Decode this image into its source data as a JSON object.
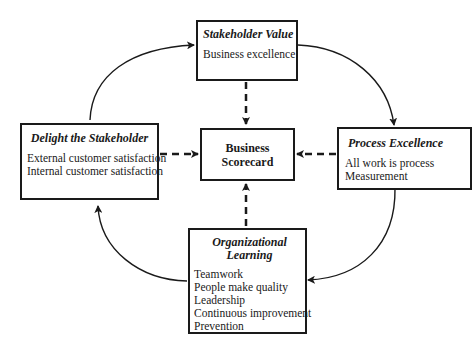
{
  "diagram": {
    "center": {
      "title_line1": "Business",
      "title_line2": "Scorecard"
    },
    "stakeholder_value": {
      "title": "Stakeholder Value",
      "items": [
        "Business excellence"
      ]
    },
    "delight_stakeholder": {
      "title": "Delight the Stakeholder",
      "items": [
        "External customer satisfaction",
        "Internal customer satisfaction"
      ]
    },
    "process_excellence": {
      "title": "Process Excellence",
      "items": [
        "All work is process",
        "Measurement"
      ]
    },
    "organizational_learning": {
      "title_line1": "Organizational",
      "title_line2": "Learning",
      "items": [
        "Teamwork",
        "People make quality",
        "Leadership",
        "Continuous improvement",
        "Prevention"
      ]
    },
    "colors": {
      "line": "#1a1a1a",
      "background": "#ffffff"
    }
  }
}
